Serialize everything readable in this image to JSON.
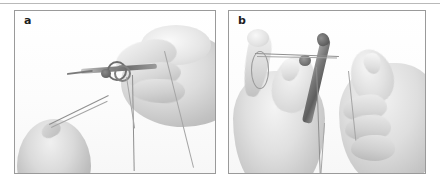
{
  "figure": {
    "panels": [
      {
        "id": "a",
        "label": "a",
        "caption_text": "",
        "scene": "grayscale photograph of a gloved right hand holding a needle holder with suture thread looped around the instrument tip, the thread running diagonally down to the left toward a thumb at the lower left",
        "elements": {
          "instrument": "needle-holder",
          "thread": "suture-thread",
          "loops": "suture-loops-around-instrument",
          "hands": "right-hand, left-thumb"
        }
      },
      {
        "id": "b",
        "label": "b",
        "caption_text": "",
        "scene": "grayscale photograph of two hands tying a surgical knot, the left hand holding the suture thread over the index finger while the right hand manipulates a needle holder",
        "elements": {
          "instrument": "needle-holder",
          "thread": "suture-thread",
          "loops": "thread-over-index-finger",
          "hands": "left-hand, right-hand"
        }
      }
    ],
    "colors": {
      "background": "#ffffff",
      "panel_border": "#9a9a9a",
      "top_rule": "#b9b9b9",
      "label_text": "#1d1d1d",
      "thread": "#8f8f8f",
      "instrument": "#6f6f6f"
    }
  }
}
